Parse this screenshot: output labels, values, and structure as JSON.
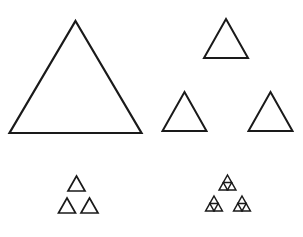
{
  "figure": {
    "background_color": "#ffffff",
    "stroke_color": "#1a1a1a",
    "width": 303,
    "height": 237,
    "shape_type": "equilateral-triangle",
    "fill": "none",
    "panel_count": 4,
    "panels": [
      {
        "id": "panel-stage-0",
        "name": "large-triangle-stage-0",
        "iteration": 0,
        "triangle_count": 1,
        "position": "top-left",
        "stroke_width": 2.2,
        "triangles": [
          {
            "cx": 75.5,
            "cy": 21.0,
            "half_width": 66.0,
            "height": 112.0
          }
        ]
      },
      {
        "id": "panel-stage-1",
        "name": "medium-triangles-stage-1",
        "iteration": 1,
        "triangle_count": 3,
        "position": "top-right",
        "stroke_width": 2.0,
        "triangles": [
          {
            "cx": 226.0,
            "cy": 19.0,
            "half_width": 22.0,
            "height": 39.0
          },
          {
            "cx": 184.5,
            "cy": 92.0,
            "half_width": 22.0,
            "height": 39.0
          },
          {
            "cx": 270.5,
            "cy": 92.0,
            "half_width": 22.0,
            "height": 39.0
          }
        ]
      },
      {
        "id": "panel-stage-2",
        "name": "small-triangles-stage-2",
        "iteration": 2,
        "triangle_count": 3,
        "position": "bottom-left",
        "stroke_width": 1.7,
        "triangles": [
          {
            "cx": 76.5,
            "cy": 176.0,
            "half_width": 8.5,
            "height": 15.0
          },
          {
            "cx": 67.0,
            "cy": 198.0,
            "half_width": 8.5,
            "height": 15.0
          },
          {
            "cx": 89.5,
            "cy": 198.0,
            "half_width": 8.5,
            "height": 15.0
          }
        ]
      },
      {
        "id": "panel-stage-3",
        "name": "tiny-triangles-stage-3",
        "iteration": 3,
        "triangle_count": 9,
        "position": "bottom-right",
        "stroke_width": 1.5,
        "clusters": [
          {
            "cx": 227.5,
            "cy": 175.0
          },
          {
            "cx": 214.0,
            "cy": 196.0
          },
          {
            "cx": 242.0,
            "cy": 196.0
          }
        ],
        "cluster_half_width": 8.5,
        "cluster_height": 15.0,
        "sub_half_width": 4.2,
        "sub_height": 7.5
      }
    ]
  }
}
